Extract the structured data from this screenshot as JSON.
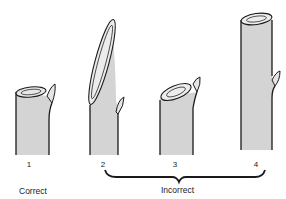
{
  "figure": {
    "stems": [
      {
        "number": "1",
        "label_x": 29
      },
      {
        "number": "2",
        "label_x": 103
      },
      {
        "number": "3",
        "label_x": 175
      },
      {
        "number": "4",
        "label_x": 256
      }
    ],
    "captions": {
      "correct": "Correct",
      "incorrect": "Incorrect"
    },
    "colors": {
      "stem_fill": "#d4d4d4",
      "outline": "#1a1a1a",
      "background": "#ffffff"
    }
  }
}
